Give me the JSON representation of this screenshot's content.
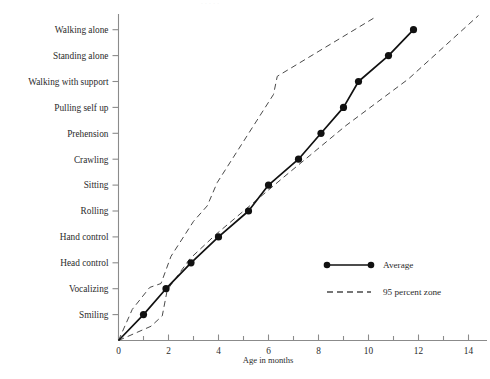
{
  "chart_data": {
    "type": "line",
    "title": "",
    "xlabel": "Age in months",
    "ylabel": "",
    "xlim": [
      0,
      14.9
    ],
    "ylim": [
      0,
      12.6
    ],
    "grid": false,
    "legend_position": "inside-right",
    "x_ticks_major": [
      0,
      2,
      4,
      6,
      8,
      10,
      12,
      14
    ],
    "x_ticks_minor": [
      1,
      3,
      5,
      7,
      9,
      11,
      13
    ],
    "x_tick_labels": [
      "0",
      "2",
      "4",
      "6",
      "8",
      "10",
      "12",
      "14"
    ],
    "y_categories": [
      "Smiling",
      "Vocalizing",
      "Head control",
      "Hand control",
      "Rolling",
      "Sitting",
      "Crawling",
      "Prehension",
      "Pulling self up",
      "Walking with support",
      "Standing alone",
      "Walking alone"
    ],
    "series": [
      {
        "name": "Average",
        "style": "solid-with-markers",
        "color": "#111111",
        "points": [
          {
            "milestone": "origin",
            "y_index": 0.0,
            "x_months": 0.0
          },
          {
            "milestone": "Smiling",
            "y_index": 1.0,
            "x_months": 1.0
          },
          {
            "milestone": "Vocalizing",
            "y_index": 2.0,
            "x_months": 1.9
          },
          {
            "milestone": "Head control",
            "y_index": 3.0,
            "x_months": 2.9
          },
          {
            "milestone": "Hand control",
            "y_index": 4.0,
            "x_months": 4.0
          },
          {
            "milestone": "Rolling",
            "y_index": 5.0,
            "x_months": 5.2
          },
          {
            "milestone": "Sitting",
            "y_index": 6.0,
            "x_months": 6.0
          },
          {
            "milestone": "Crawling",
            "y_index": 7.0,
            "x_months": 7.2
          },
          {
            "milestone": "Prehension",
            "y_index": 8.0,
            "x_months": 8.1
          },
          {
            "milestone": "Pulling self up",
            "y_index": 9.0,
            "x_months": 9.0
          },
          {
            "milestone": "Walking with support",
            "y_index": 10.0,
            "x_months": 9.6
          },
          {
            "milestone": "Standing alone",
            "y_index": 11.0,
            "x_months": 10.8
          },
          {
            "milestone": "Walking alone",
            "y_index": 12.0,
            "x_months": 11.8
          }
        ]
      },
      {
        "name": "95 percent zone upper",
        "style": "dashed",
        "color": "#4a4a4a",
        "points": [
          {
            "y_index": 0.0,
            "x_months": 0.0
          },
          {
            "y_index": 1.2,
            "x_months": 0.55
          },
          {
            "y_index": 2.05,
            "x_months": 1.25
          },
          {
            "y_index": 2.2,
            "x_months": 1.7
          },
          {
            "y_index": 3.25,
            "x_months": 2.1
          },
          {
            "y_index": 4.6,
            "x_months": 3.0
          },
          {
            "y_index": 5.2,
            "x_months": 3.55
          },
          {
            "y_index": 6.1,
            "x_months": 3.95
          },
          {
            "y_index": 9.5,
            "x_months": 6.2
          },
          {
            "y_index": 10.2,
            "x_months": 6.35
          },
          {
            "y_index": 12.5,
            "x_months": 10.3
          }
        ]
      },
      {
        "name": "95 percent zone lower",
        "style": "dashed",
        "color": "#4a4a4a",
        "points": [
          {
            "y_index": 0.0,
            "x_months": 0.0
          },
          {
            "y_index": 0.55,
            "x_months": 1.3
          },
          {
            "y_index": 0.95,
            "x_months": 1.75
          },
          {
            "y_index": 1.95,
            "x_months": 1.95
          },
          {
            "y_index": 3.15,
            "x_months": 2.85
          },
          {
            "y_index": 4.1,
            "x_months": 3.9
          },
          {
            "y_index": 6.3,
            "x_months": 6.6
          },
          {
            "y_index": 8.3,
            "x_months": 9.1
          },
          {
            "y_index": 10.1,
            "x_months": 11.6
          },
          {
            "y_index": 12.55,
            "x_months": 14.4
          }
        ]
      }
    ],
    "legend": [
      {
        "label": "Average",
        "style": "solid-with-markers"
      },
      {
        "label": "95 percent zone",
        "style": "dashed"
      }
    ],
    "annotations": []
  },
  "cropped_caption_fragment": "·  ·  ·   ·  ·"
}
